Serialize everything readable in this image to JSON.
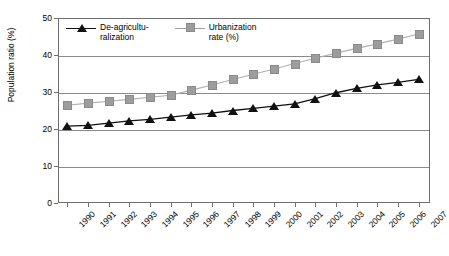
{
  "chart_data": {
    "type": "line",
    "title": "",
    "xlabel": "",
    "ylabel": "Population ratio (%)",
    "ylim": [
      0,
      50
    ],
    "yticks": [
      0,
      10,
      20,
      30,
      40,
      50
    ],
    "grid": true,
    "legend_position": "top-left-inside",
    "categories": [
      "1990",
      "1991",
      "1992",
      "1993",
      "1994",
      "1995",
      "1996",
      "1997",
      "1998",
      "1999",
      "2000",
      "2001",
      "2002",
      "2003",
      "2004",
      "2005",
      "2006",
      "2007"
    ],
    "series": [
      {
        "name": "De-agriculturalization",
        "legend_label": "De-agricultu-\nralization",
        "marker": "triangle",
        "color": "#111111",
        "values": [
          20.8,
          21.0,
          21.6,
          22.2,
          22.6,
          23.2,
          23.8,
          24.3,
          25.0,
          25.6,
          26.2,
          26.8,
          28.2,
          29.8,
          31.0,
          31.9,
          32.6,
          33.4
        ]
      },
      {
        "name": "Urbanization rate (%)",
        "legend_label": "Urbanization\nrate (%)",
        "marker": "square",
        "color": "#9d9d9d",
        "values": [
          26.4,
          27.0,
          27.5,
          28.0,
          28.6,
          29.1,
          30.5,
          31.9,
          33.4,
          34.8,
          36.2,
          37.7,
          39.1,
          40.5,
          41.8,
          43.0,
          44.3,
          45.7
        ]
      }
    ]
  },
  "axis": {
    "y_title": "Population ratio (%)",
    "y_tick_labels": [
      "50",
      "40",
      "30",
      "20",
      "10",
      "0"
    ],
    "x_tick_labels": [
      "1990",
      "1991",
      "1992",
      "1993",
      "1994",
      "1995",
      "1996",
      "1997",
      "1998",
      "1999",
      "2000",
      "2001",
      "2002",
      "2003",
      "2004",
      "2005",
      "2006",
      "2007"
    ]
  },
  "legend": {
    "entries": [
      {
        "label": "De-agricultu-\nralization",
        "marker": "triangle-marker",
        "color": "#111111"
      },
      {
        "label": "Urbanization\nrate (%)",
        "marker": "square-marker",
        "color": "#9d9d9d"
      }
    ]
  }
}
